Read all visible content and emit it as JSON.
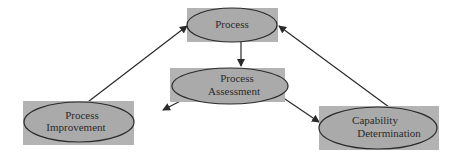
{
  "diagram": {
    "colors": {
      "box_fill": "#b3b3b3",
      "ellipse_fill": "#aaaaaa",
      "stroke": "#2a2a2a",
      "background": "#ffffff"
    },
    "nodes": [
      {
        "id": "process",
        "lines": [
          "Process"
        ]
      },
      {
        "id": "process-assessment",
        "lines": [
          "Process",
          "Assessment"
        ]
      },
      {
        "id": "process-improvement",
        "lines": [
          "Process",
          "Improvement"
        ]
      },
      {
        "id": "capability-determination",
        "lines": [
          "Capability",
          "Determination"
        ]
      }
    ],
    "edges": [
      {
        "from": "process",
        "to": "process-assessment"
      },
      {
        "from": "process-assessment",
        "to": "process-improvement"
      },
      {
        "from": "process-assessment",
        "to": "capability-determination"
      },
      {
        "from": "process-improvement",
        "to": "process"
      },
      {
        "from": "capability-determination",
        "to": "process"
      }
    ]
  }
}
